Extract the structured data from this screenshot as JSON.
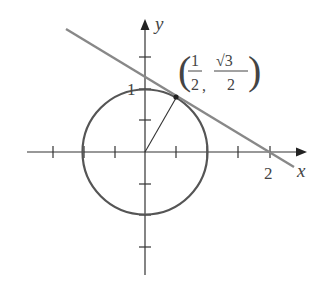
{
  "diagram": {
    "type": "unit-circle-tangent-line",
    "axes": {
      "x_label": "x",
      "y_label": "y",
      "x_tick_label": "2",
      "y_tick_label": "1",
      "tick_spacing": 0.5
    },
    "circle": {
      "center": [
        0,
        0
      ],
      "radius": 1
    },
    "point": {
      "coords": [
        0.5,
        0.866
      ],
      "label_x_num": "1",
      "label_x_den": "2",
      "label_y_num": "√3",
      "label_y_den": "2",
      "separator": ","
    },
    "tangent_line": {
      "passes_through": [
        [
          0.5,
          0.866
        ],
        [
          2,
          0
        ]
      ]
    },
    "radius_segment": {
      "from": [
        0,
        0
      ],
      "to": [
        0.5,
        0.866
      ]
    },
    "colors": {
      "axes": "#333333",
      "circle": "#555555",
      "tangent": "#888888",
      "text": "#444444"
    }
  }
}
